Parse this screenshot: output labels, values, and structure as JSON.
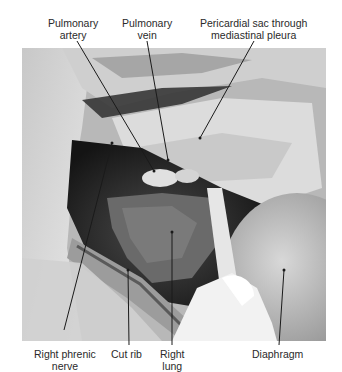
{
  "figure": {
    "type": "anatomical-photograph",
    "tone": "grayscale",
    "labels_top": [
      {
        "id": "pulmonary-artery",
        "line1": "Pulmonary",
        "line2": "artery"
      },
      {
        "id": "pulmonary-vein",
        "line1": "Pulmonary",
        "line2": "vein"
      },
      {
        "id": "pericardial-sac",
        "line1": "Pericardial sac through",
        "line2": "mediastinal pleura"
      }
    ],
    "labels_bottom": [
      {
        "id": "right-phrenic-nerve",
        "line1": "Right phrenic",
        "line2": "nerve"
      },
      {
        "id": "cut-rib",
        "line1": "Cut rib",
        "line2": ""
      },
      {
        "id": "right-lung",
        "line1": "Right",
        "line2": "lung"
      },
      {
        "id": "diaphragm",
        "line1": "Diaphragm",
        "line2": ""
      }
    ]
  }
}
